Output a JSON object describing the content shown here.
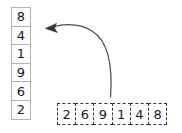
{
  "diagram": {
    "background_color": "#ffffff",
    "column": {
      "name": "vertical-array",
      "orientation": "vertical",
      "border_style": "solid",
      "border_color": "#b4b4b4",
      "fill_color": "#fdfdfd",
      "text_color": "#1a1a1a",
      "cells": [
        {
          "value": "8"
        },
        {
          "value": "4"
        },
        {
          "value": "1"
        },
        {
          "value": "9"
        },
        {
          "value": "6"
        },
        {
          "value": "2"
        }
      ]
    },
    "row": {
      "name": "horizontal-array",
      "orientation": "horizontal",
      "border_style": "dashed",
      "border_color": "#333333",
      "fill_color": "#ffffff",
      "text_color": "#1a1a1a",
      "cells": [
        {
          "value": "2"
        },
        {
          "value": "6"
        },
        {
          "value": "9"
        },
        {
          "value": "1"
        },
        {
          "value": "4"
        },
        {
          "value": "8"
        }
      ]
    },
    "arrow": {
      "name": "curved-arrow",
      "color": "#4d4d4d",
      "direction": "from-row-to-column-top",
      "head_position": "left"
    }
  }
}
